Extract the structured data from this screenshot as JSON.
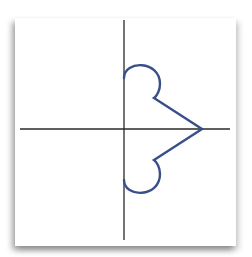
{
  "figure": {
    "colors": {
      "background": "#ffffff",
      "axes": "#2a2a2a",
      "curve": "#3a4f8a"
    },
    "axes": {
      "horizontal": {
        "x1": 20,
        "y1": 129,
        "x2": 230,
        "y2": 129
      },
      "vertical": {
        "x1": 124,
        "y1": 20,
        "x2": 124,
        "y2": 240
      }
    },
    "curve_path": "M124,78 C124,60 160,60 160,84 C160,90 157,96 154,98 L202,129 L154,160 C157,162 160,168 160,174 C160,198 124,198 124,180"
  }
}
